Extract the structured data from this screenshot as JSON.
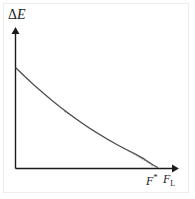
{
  "chart_data": {
    "type": "line",
    "title": "",
    "subtitle": "",
    "xlabel": "F_L",
    "ylabel": "ΔE",
    "xlim": [
      0,
      1
    ],
    "ylim": [
      0,
      1
    ],
    "grid": false,
    "legend": null,
    "annotations": [
      {
        "name": "f-star-marker",
        "label": "F*",
        "x": 0.865,
        "y": 0.0
      },
      {
        "name": "f-l-axis-label",
        "label": "F_L",
        "x": 1.0,
        "y": 0.0
      }
    ],
    "series": [
      {
        "name": "energy-barrier-curve",
        "style": "solid",
        "color": "#4d4d4d",
        "x": [
          0.0,
          0.062,
          0.124,
          0.187,
          0.249,
          0.311,
          0.373,
          0.436,
          0.498,
          0.56,
          0.622,
          0.685,
          0.747,
          0.809,
          0.871,
          0.933,
          0.963
        ],
        "y": [
          1.0,
          0.912,
          0.828,
          0.748,
          0.671,
          0.598,
          0.529,
          0.463,
          0.401,
          0.342,
          0.287,
          0.235,
          0.187,
          0.142,
          0.091,
          0.03,
          0.005
        ]
      },
      {
        "name": "asymptotic-dotted-branch",
        "style": "dotted",
        "color": "#9a9a9a",
        "x": [
          0.33,
          0.4,
          0.47,
          0.54,
          0.61,
          0.68,
          0.75,
          0.82,
          0.88,
          0.93
        ],
        "y": [
          0.565,
          0.497,
          0.43,
          0.365,
          0.302,
          0.241,
          0.181,
          0.122,
          0.07,
          0.02
        ]
      }
    ]
  },
  "axes": {
    "y_axis": {
      "label": "ΔE",
      "label_delta": "Δ",
      "label_symbol": "E",
      "arrow": "up-arrow"
    },
    "x_axis": {
      "label": "F",
      "label_subscript": "L",
      "arrow": "right-arrow"
    },
    "tick_marker": {
      "label": "F",
      "superscript": "*"
    }
  },
  "colors": {
    "axis": "#1a1a1a",
    "curve": "#4d4d4d",
    "dotted": "#9a9a9a",
    "frame": "#ececec",
    "background": "#ffffff"
  }
}
